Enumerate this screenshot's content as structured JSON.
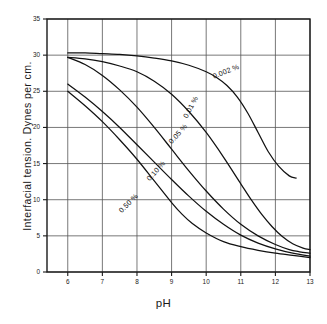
{
  "chart_data": {
    "type": "line",
    "title": "",
    "xlabel": "pH",
    "ylabel": "Interfacial tension. Dynes per cm.",
    "xlim": [
      5.4,
      13
    ],
    "ylim": [
      0,
      35
    ],
    "xticks": [
      "6",
      "7",
      "8",
      "9",
      "10",
      "11",
      "12",
      "13"
    ],
    "yticks": [
      "0",
      "5",
      "10",
      "15",
      "20",
      "25",
      "30",
      "35"
    ],
    "grid": true,
    "legend_position": "inline-curve-labels",
    "series": [
      {
        "name": "0.002 %",
        "label": "0.002 %",
        "x": [
          6.0,
          6.5,
          7.0,
          7.5,
          8.0,
          8.5,
          9.0,
          9.5,
          10.0,
          10.3,
          10.6,
          10.9,
          11.2,
          11.5,
          11.8,
          12.1,
          12.4,
          12.6
        ],
        "y": [
          30.3,
          30.3,
          30.2,
          30.1,
          29.9,
          29.6,
          29.2,
          28.6,
          27.7,
          26.9,
          25.8,
          24.2,
          22.0,
          19.3,
          16.6,
          14.6,
          13.3,
          13.0
        ]
      },
      {
        "name": "0.01 %",
        "label": "0.01 %",
        "x": [
          6.0,
          6.5,
          7.0,
          7.5,
          8.0,
          8.5,
          9.0,
          9.5,
          10.0,
          10.5,
          11.0,
          11.3,
          11.6,
          11.9,
          12.2,
          12.5,
          12.8,
          13.0
        ],
        "y": [
          29.7,
          29.5,
          29.1,
          28.5,
          27.7,
          26.4,
          24.6,
          22.2,
          19.3,
          15.9,
          12.2,
          10.0,
          8.0,
          6.3,
          4.9,
          3.9,
          3.3,
          3.1
        ]
      },
      {
        "name": "0.05 %",
        "label": "0.05 %",
        "x": [
          6.0,
          6.5,
          7.0,
          7.5,
          8.0,
          8.5,
          9.0,
          9.5,
          10.0,
          10.5,
          11.0,
          11.5,
          12.0,
          12.4,
          12.7,
          13.0
        ],
        "y": [
          29.7,
          28.7,
          27.2,
          25.2,
          22.8,
          20.0,
          17.0,
          14.0,
          11.2,
          8.7,
          6.6,
          5.0,
          3.8,
          3.1,
          2.8,
          2.6
        ]
      },
      {
        "name": "0.10 %",
        "label": "0.10 %",
        "x": [
          6.0,
          6.5,
          7.0,
          7.5,
          8.0,
          8.5,
          9.0,
          9.5,
          10.0,
          10.5,
          11.0,
          11.5,
          12.0,
          12.5,
          13.0
        ],
        "y": [
          26.0,
          24.2,
          22.2,
          20.0,
          17.6,
          15.2,
          12.8,
          10.5,
          8.4,
          6.6,
          5.1,
          4.0,
          3.2,
          2.6,
          2.2
        ]
      },
      {
        "name": "0.50 %",
        "label": "0.50 %",
        "x": [
          6.0,
          6.5,
          7.0,
          7.5,
          8.0,
          8.5,
          9.0,
          9.3,
          9.6,
          10.0,
          10.5,
          11.0,
          11.5,
          12.0,
          12.5,
          13.0
        ],
        "y": [
          25.0,
          23.0,
          20.8,
          18.3,
          15.6,
          12.6,
          9.6,
          8.0,
          6.7,
          5.4,
          4.2,
          3.5,
          3.0,
          2.6,
          2.3,
          2.0
        ]
      }
    ],
    "curve_labels": [
      {
        "text": "0.002 %",
        "x_px": 213,
        "y_px": 72,
        "rotation": -22
      },
      {
        "text": "0.01 %",
        "x_px": 185,
        "y_px": 113,
        "rotation": -62
      },
      {
        "text": "0.05 %",
        "x_px": 170,
        "y_px": 138,
        "rotation": -48
      },
      {
        "text": "0.10 %",
        "x_px": 148,
        "y_px": 175,
        "rotation": -48
      },
      {
        "text": "0.50 %",
        "x_px": 120,
        "y_px": 207,
        "rotation": -45
      }
    ],
    "colors": {
      "curve": "#111111",
      "grid": "#555555",
      "axis": "#1a1a1a",
      "background": "#ffffff"
    }
  }
}
